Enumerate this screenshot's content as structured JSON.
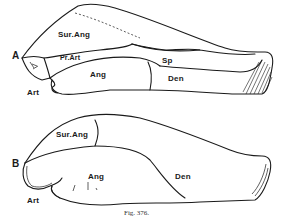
{
  "figure": {
    "caption": "Fig. 376.",
    "panels": [
      {
        "id": "A",
        "label": "A",
        "parts": {
          "sur_ang": "Sur.Ang",
          "pr_art": "Pr.Art",
          "ang": "Ang",
          "sp": "Sp",
          "den": "Den",
          "art": "Art"
        }
      },
      {
        "id": "B",
        "label": "B",
        "parts": {
          "sur_ang": "Sur.Ang",
          "ang": "Ang",
          "den": "Den",
          "art": "Art"
        }
      }
    ]
  },
  "colors": {
    "ink": "#1a1a1a",
    "paper": "#ffffff"
  }
}
